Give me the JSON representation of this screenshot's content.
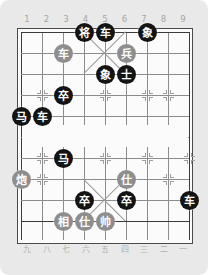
{
  "app": {
    "title": "Xiangqi Board",
    "background_color": "#e9e9e9",
    "board_color": "#fbfbfb"
  },
  "board": {
    "columns": 9,
    "rows": 10,
    "top_file_labels": [
      "1",
      "2",
      "3",
      "4",
      "5",
      "6",
      "7",
      "8",
      "9"
    ],
    "bottom_file_labels": [
      "九",
      "八",
      "七",
      "六",
      "五",
      "四",
      "三",
      "二",
      "一"
    ],
    "colors": {
      "black_piece": "#141414",
      "red_piece": "#8e8e8e",
      "piece_text": "#ffffff",
      "grid_line": "#8c8c8c",
      "border_line": "#3a3a3a",
      "label_text": "#a6a6a6"
    }
  },
  "pieces": [
    {
      "name": "general-black",
      "label": "将",
      "side": "black",
      "col": 4,
      "row": 0
    },
    {
      "name": "chariot-black-1",
      "label": "车",
      "side": "black",
      "col": 5,
      "row": 0
    },
    {
      "name": "elephant-black-1",
      "label": "象",
      "side": "black",
      "col": 7,
      "row": 0
    },
    {
      "name": "chariot-red-1",
      "label": "车",
      "side": "red",
      "col": 3,
      "row": 1
    },
    {
      "name": "soldier-red-1",
      "label": "兵",
      "side": "red",
      "col": 6,
      "row": 1
    },
    {
      "name": "elephant-black-2",
      "label": "象",
      "side": "black",
      "col": 5,
      "row": 2
    },
    {
      "name": "advisor-black-1",
      "label": "士",
      "side": "black",
      "col": 6,
      "row": 2
    },
    {
      "name": "soldier-black-1",
      "label": "卒",
      "side": "black",
      "col": 3,
      "row": 3
    },
    {
      "name": "horse-black-1",
      "label": "马",
      "side": "black",
      "col": 1,
      "row": 4
    },
    {
      "name": "chariot-black-2",
      "label": "车",
      "side": "black",
      "col": 2,
      "row": 4
    },
    {
      "name": "horse-black-2",
      "label": "马",
      "side": "black",
      "col": 3,
      "row": 6
    },
    {
      "name": "cannon-red-1",
      "label": "炮",
      "side": "red",
      "col": 1,
      "row": 7
    },
    {
      "name": "advisor-red-1",
      "label": "仕",
      "side": "red",
      "col": 6,
      "row": 7
    },
    {
      "name": "soldier-black-2",
      "label": "卒",
      "side": "black",
      "col": 4,
      "row": 8
    },
    {
      "name": "soldier-black-3",
      "label": "卒",
      "side": "black",
      "col": 6,
      "row": 8
    },
    {
      "name": "chariot-black-3",
      "label": "车",
      "side": "black",
      "col": 9,
      "row": 8
    },
    {
      "name": "minister-red-1",
      "label": "相",
      "side": "red",
      "col": 3,
      "row": 9
    },
    {
      "name": "advisor-red-2",
      "label": "仕",
      "side": "red",
      "col": 4,
      "row": 9
    },
    {
      "name": "marshal-red",
      "label": "帅",
      "side": "red",
      "col": 5,
      "row": 9
    }
  ],
  "markers": [
    {
      "col": 2,
      "row": 3
    },
    {
      "col": 8,
      "row": 3
    },
    {
      "col": 5,
      "row": 3
    },
    {
      "col": 7,
      "row": 3
    },
    {
      "col": 2,
      "row": 6
    },
    {
      "col": 5,
      "row": 6
    },
    {
      "col": 7,
      "row": 6
    },
    {
      "col": 9,
      "row": 6
    },
    {
      "col": 2,
      "row": 7
    },
    {
      "col": 8,
      "row": 7
    }
  ]
}
